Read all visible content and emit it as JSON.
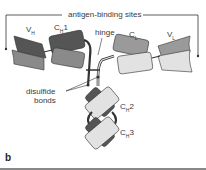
{
  "diagram": {
    "panel_label": "b",
    "title_label": "antigen-binding sites",
    "labels": {
      "vh": {
        "main": "V",
        "sub": "H"
      },
      "ch1": {
        "main": "C",
        "sub": "H",
        "suffix": "1"
      },
      "cl": {
        "main": "C",
        "sub": "L"
      },
      "vl": {
        "main": "V",
        "sub": "L"
      },
      "hinge": "hinge",
      "disulfide_line1": "disulfide",
      "disulfide_line2": "bonds",
      "ch2": {
        "main": "C",
        "sub": "H",
        "suffix": "2"
      },
      "ch3": {
        "main": "C",
        "sub": "H",
        "suffix": "3"
      }
    },
    "colors": {
      "heavy_dark": "#555555",
      "heavy_mid": "#8a8a8a",
      "light_mid": "#9a9a9a",
      "light_pale": "#e2e2e2",
      "outline": "#333333",
      "border": "#888888"
    }
  }
}
